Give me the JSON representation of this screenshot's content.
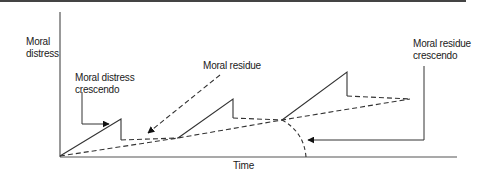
{
  "diagram": {
    "colors": {
      "line": "#333333",
      "axis": "#555555",
      "top_border": "#444444",
      "text": "#1a1a1a",
      "background": "#ffffff"
    },
    "axes": {
      "y_label": "Moral\ndistress",
      "x_label": "Time"
    },
    "annotations": {
      "moral_distress_crescendo": "Moral distress\ncrescendo",
      "moral_residue": "Moral residue",
      "moral_residue_crescendo": "Moral residue\ncrescendo"
    },
    "series": {
      "moral_distress_episodes": {
        "style": "solid",
        "episodes": [
          {
            "start": [
              60,
              156
            ],
            "peak": [
              121,
              119
            ],
            "drop_to": [
              121,
              140
            ]
          },
          {
            "start": [
              178,
              138
            ],
            "peak": [
              233,
              99
            ],
            "drop_to": [
              233,
              118
            ]
          },
          {
            "start": [
              282,
              120
            ],
            "peak": [
              347,
              72
            ],
            "drop_to": [
              347,
              96
            ]
          }
        ]
      },
      "residue_plateaus": {
        "style": "dashed",
        "segments": [
          [
            [
              121,
              140
            ],
            [
              178,
              138
            ]
          ],
          [
            [
              233,
              118
            ],
            [
              282,
              120
            ]
          ],
          [
            [
              347,
              96
            ],
            [
              410,
              99
            ]
          ]
        ]
      },
      "residue_baseline": {
        "style": "dashed",
        "points": [
          [
            60,
            156
          ],
          [
            178,
            138
          ],
          [
            282,
            120
          ],
          [
            410,
            99
          ]
        ]
      }
    }
  }
}
